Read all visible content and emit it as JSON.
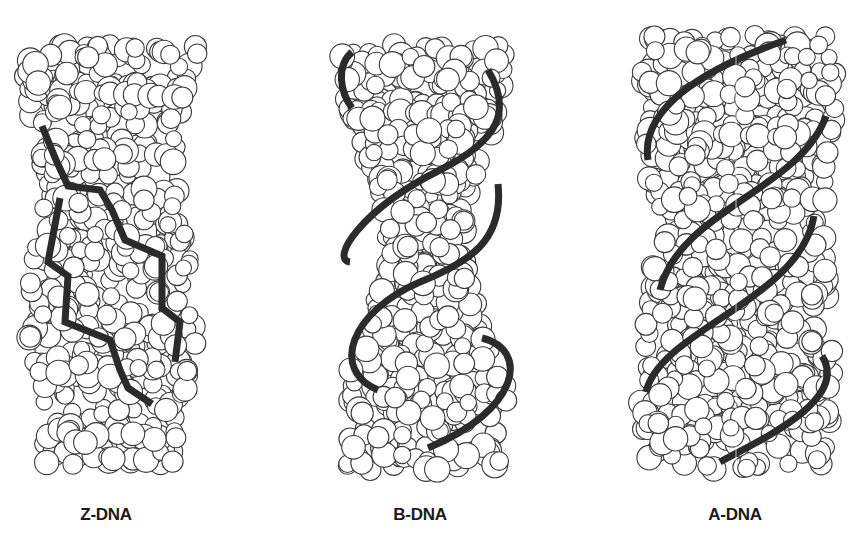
{
  "figure": {
    "panels": [
      {
        "id": "z-dna",
        "label": "Z-DNA",
        "center_x": 106,
        "helix": "left-handed zigzag backbone"
      },
      {
        "id": "b-dna",
        "label": "B-DNA",
        "center_x": 420,
        "helix": "right-handed, wide major groove"
      },
      {
        "id": "a-dna",
        "label": "A-DNA",
        "center_x": 735,
        "helix": "right-handed, compact"
      }
    ],
    "colors": {
      "background": "#ffffff",
      "atom_fill": "#ffffff",
      "atom_outline": "#3a3a3a",
      "backbone": "#2b2b2b",
      "label_text": "#1a1a1a"
    }
  }
}
